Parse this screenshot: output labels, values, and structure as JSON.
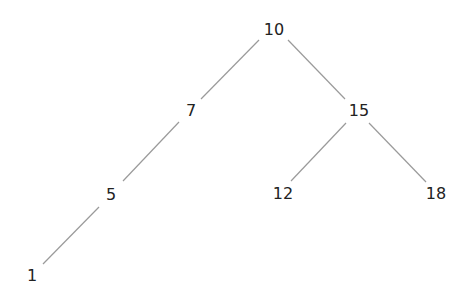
{
  "diagram": {
    "type": "binary-search-tree",
    "nodes": [
      {
        "id": "n10",
        "label": "10",
        "x": 274,
        "y": 30
      },
      {
        "id": "n7",
        "label": "7",
        "x": 191,
        "y": 111
      },
      {
        "id": "n15",
        "label": "15",
        "x": 359,
        "y": 111
      },
      {
        "id": "n5",
        "label": "5",
        "x": 111,
        "y": 195
      },
      {
        "id": "n12",
        "label": "12",
        "x": 283,
        "y": 194
      },
      {
        "id": "n18",
        "label": "18",
        "x": 436,
        "y": 194
      },
      {
        "id": "n1",
        "label": "1",
        "x": 32,
        "y": 276
      }
    ],
    "edges": [
      {
        "from": "10",
        "to": "7",
        "x1": 259,
        "y1": 40,
        "x2": 201,
        "y2": 99
      },
      {
        "from": "10",
        "to": "15",
        "x1": 288,
        "y1": 40,
        "x2": 345,
        "y2": 99
      },
      {
        "from": "7",
        "to": "5",
        "x1": 179,
        "y1": 122,
        "x2": 123,
        "y2": 181
      },
      {
        "from": "15",
        "to": "12",
        "x1": 346,
        "y1": 123,
        "x2": 291,
        "y2": 181
      },
      {
        "from": "15",
        "to": "18",
        "x1": 369,
        "y1": 123,
        "x2": 426,
        "y2": 182
      },
      {
        "from": "5",
        "to": "1",
        "x1": 99,
        "y1": 207,
        "x2": 43,
        "y2": 264
      }
    ],
    "colors": {
      "edge": "#9a9a9a",
      "text": "#222222",
      "background": "#ffffff"
    }
  }
}
